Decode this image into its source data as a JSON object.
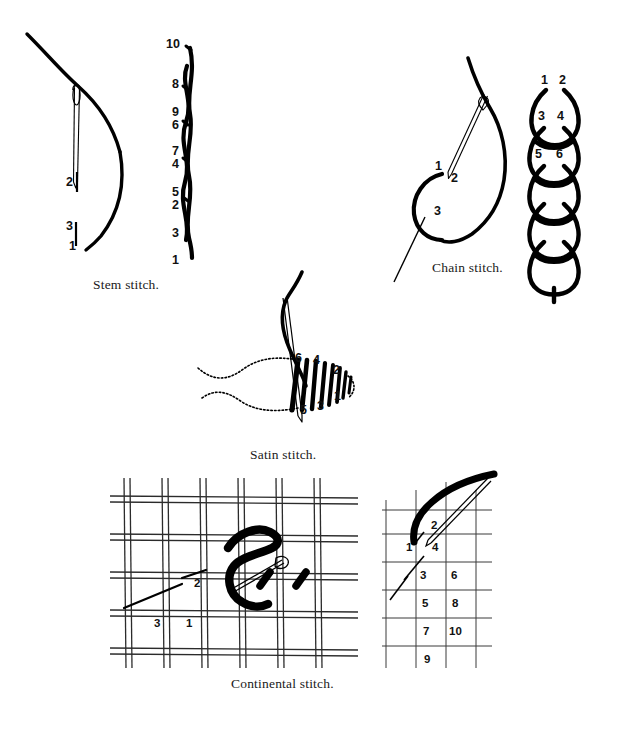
{
  "page": {
    "background_color": "#ffffff",
    "ink_color": "#000000",
    "width": 618,
    "height": 731
  },
  "figures": [
    {
      "id": "stem-stitch",
      "caption": "Stem stitch.",
      "needle_diagram_numbers": [
        "2",
        "3",
        "1"
      ],
      "worked_sample_numbers": [
        "10",
        "8",
        "9",
        "6",
        "7",
        "4",
        "5",
        "2",
        "3",
        "1"
      ]
    },
    {
      "id": "chain-stitch",
      "caption": "Chain stitch.",
      "needle_diagram_numbers": [
        "1",
        "2",
        "3"
      ],
      "worked_sample_numbers": [
        "1",
        "2",
        "3",
        "4",
        "5",
        "6"
      ],
      "loop_count": 5
    },
    {
      "id": "satin-stitch",
      "caption": "Satin stitch.",
      "numbers_top": [
        "6",
        "4",
        "2"
      ],
      "numbers_bottom": [
        "5",
        "3",
        "1"
      ],
      "stitch_count": 8
    },
    {
      "id": "continental-stitch",
      "caption": "Continental stitch.",
      "canvas_numbers": [
        "3",
        "1",
        "2"
      ],
      "grid_numbers_left": [
        "1",
        "3",
        "5",
        "7",
        "9"
      ],
      "grid_numbers_right": [
        "2",
        "4",
        "6",
        "8",
        "10"
      ]
    }
  ],
  "labels": {
    "stem": {
      "n1": "1",
      "n2": "2",
      "n3": "3",
      "s1": "1",
      "s2": "2",
      "s3": "3",
      "s4": "4",
      "s5": "5",
      "s6": "6",
      "s7": "7",
      "s8": "8",
      "s9": "9",
      "s10": "10"
    },
    "chain": {
      "n1": "1",
      "n2": "2",
      "n3": "3",
      "c1": "1",
      "c2": "2",
      "c3": "3",
      "c4": "4",
      "c5": "5",
      "c6": "6"
    },
    "satin": {
      "t6": "6",
      "t4": "4",
      "t2": "2",
      "b5": "5",
      "b3": "3",
      "b1": "1"
    },
    "continental": {
      "k3": "3",
      "k1": "1",
      "k2": "2",
      "g1": "1",
      "g2": "2",
      "g4": "4",
      "g3": "3",
      "g6": "6",
      "g5": "5",
      "g8": "8",
      "g7": "7",
      "g10": "10",
      "g9": "9"
    }
  },
  "captions": {
    "stem": "Stem stitch.",
    "chain": "Chain stitch.",
    "satin": "Satin stitch.",
    "continental": "Continental stitch."
  }
}
